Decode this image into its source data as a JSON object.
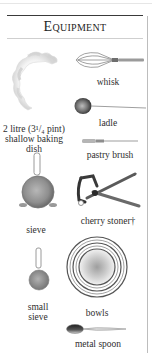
{
  "panel": {
    "title": "Equipment"
  },
  "items": [
    {
      "id": "dish",
      "label_lines": [
        "2 litre (3¹/₄ pint)",
        "shallow baking",
        "dish"
      ],
      "icon": "baking-dish"
    },
    {
      "id": "whisk",
      "label": "whisk",
      "icon": "whisk"
    },
    {
      "id": "ladle",
      "label": "ladle",
      "icon": "ladle"
    },
    {
      "id": "pastry_brush",
      "label": "pastry brush",
      "icon": "pastry-brush"
    },
    {
      "id": "sieve",
      "label": "sieve",
      "icon": "sieve"
    },
    {
      "id": "cherry_stoner",
      "label": "cherry stoner†",
      "icon": "cherry-stoner"
    },
    {
      "id": "small_sieve",
      "label_lines": [
        "small",
        "sieve"
      ],
      "icon": "small-sieve"
    },
    {
      "id": "bowls",
      "label": "bowls",
      "icon": "bowls"
    },
    {
      "id": "metal_spoon",
      "label": "metal spoon",
      "icon": "metal-spoon"
    }
  ],
  "labels": {
    "dish_1": "2 litre (3¹/₄ pint)",
    "dish_2": "shallow baking",
    "dish_3": "dish",
    "whisk": "whisk",
    "ladle": "ladle",
    "pastry_brush": "pastry brush",
    "sieve": "sieve",
    "cherry_stoner": "cherry stoner†",
    "small_sieve_1": "small",
    "small_sieve_2": "sieve",
    "bowls": "bowls",
    "metal_spoon": "metal spoon"
  }
}
